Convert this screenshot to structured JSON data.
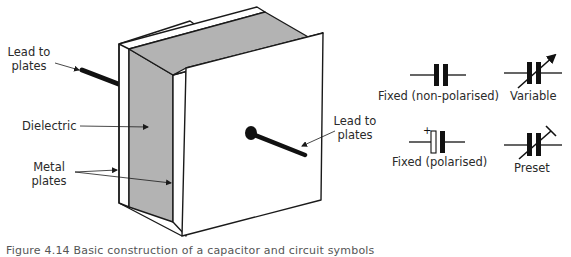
{
  "diagram": {
    "construction_labels": {
      "lead_left_line1": "Lead to",
      "lead_left_line2": "plates",
      "dielectric": "Dielectric",
      "metal_line1": "Metal",
      "metal_line2": "plates",
      "lead_right_line1": "Lead to",
      "lead_right_line2": "plates"
    },
    "symbols": [
      {
        "label": "Fixed (non-polarised)",
        "icon": "capacitor-fixed-icon"
      },
      {
        "label": "Variable",
        "icon": "capacitor-variable-icon"
      },
      {
        "label": "Fixed (polarised)",
        "icon": "capacitor-polarised-icon",
        "polarity_mark": "+"
      },
      {
        "label": "Preset",
        "icon": "capacitor-preset-icon"
      }
    ],
    "colors": {
      "dielectric": "#b3b3b3",
      "line": "#1a1a1a",
      "plate": "#ffffff"
    },
    "caption": "Figure 4.14 Basic construction of a capacitor and circuit symbols"
  }
}
